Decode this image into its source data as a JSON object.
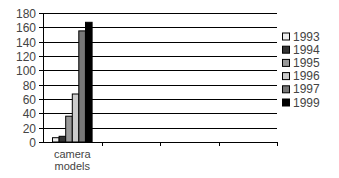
{
  "chart_data": {
    "type": "bar",
    "title": "",
    "xlabel": "",
    "ylabel": "",
    "categories": [
      "camera models"
    ],
    "category_slots": 4,
    "ylim": [
      0,
      180
    ],
    "yticks": [
      0,
      20,
      40,
      60,
      80,
      100,
      120,
      140,
      160,
      180
    ],
    "grid": true,
    "legend_position": "right",
    "series": [
      {
        "name": "1993",
        "values": [
          6
        ],
        "color": "#eeeeee"
      },
      {
        "name": "1994",
        "values": [
          8
        ],
        "color": "#333333"
      },
      {
        "name": "1995",
        "values": [
          36
        ],
        "color": "#999999"
      },
      {
        "name": "1996",
        "values": [
          67
        ],
        "color": "#cccccc"
      },
      {
        "name": "1997",
        "values": [
          155
        ],
        "color": "#777777"
      },
      {
        "name": "1999",
        "values": [
          167
        ],
        "color": "#000000"
      }
    ]
  }
}
